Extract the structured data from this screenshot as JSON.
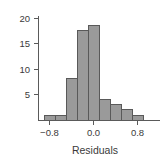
{
  "chart_data": {
    "type": "bar",
    "title": "",
    "subtitle": "",
    "xlabel": "Residuals",
    "ylabel": "",
    "grid": false,
    "legend": null,
    "bin_width": 0.2,
    "bin_edges": [
      -0.9,
      -0.7,
      -0.5,
      -0.3,
      -0.1,
      0.1,
      0.3,
      0.5,
      0.7,
      0.9,
      1.0
    ],
    "categories": [
      "-0.9 to -0.7",
      "-0.7 to -0.5",
      "-0.5 to -0.3",
      "-0.3 to -0.1",
      "-0.1 to 0.1",
      "0.1 to 0.3",
      "0.3 to 0.5",
      "0.5 to 0.7",
      "0.7 to 0.9",
      "0.9 to 1.0"
    ],
    "values": [
      1,
      1,
      8,
      17.3,
      18.2,
      4,
      3,
      2.2,
      1,
      0
    ],
    "x": [
      -0.8,
      -0.6,
      -0.4,
      -0.2,
      0.0,
      0.2,
      0.4,
      0.6,
      0.8,
      0.95
    ],
    "xlim": [
      -1.0,
      1.05
    ],
    "ylim": [
      0,
      21
    ],
    "xticks": [
      -0.8,
      0.0,
      0.8
    ],
    "xtick_labels": [
      "−0.8",
      "0.0",
      "0.8"
    ],
    "yticks": [
      5,
      10,
      15,
      20
    ],
    "ytick_labels": [
      "5",
      "10",
      "15",
      "20"
    ],
    "bar_fill": "#9a9a9a",
    "bar_stroke": "#595959",
    "axis_color": "#5a5a5a",
    "text_color": "#3a3a3a",
    "background": "#ffffff"
  },
  "labels": {
    "x_axis_title": "Residuals",
    "ytick_20": "20",
    "ytick_15": "15",
    "ytick_10": "10",
    "ytick_5": "5",
    "xtick_neg08": "−0.8",
    "xtick_00": "0.0",
    "xtick_08": "0.8"
  }
}
